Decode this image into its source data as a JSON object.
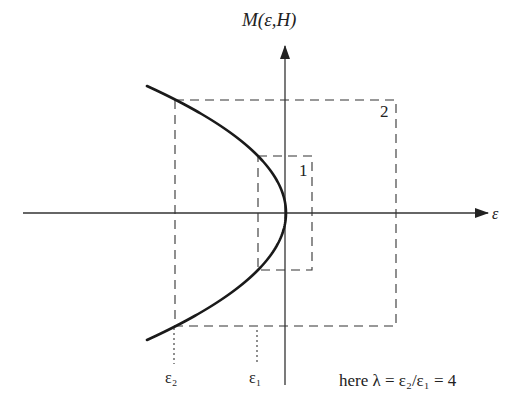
{
  "figure": {
    "y_axis_label": "M(ε,H)",
    "x_axis_label": "ε",
    "box_labels": [
      "1",
      "2"
    ],
    "tick_labels": {
      "eps2": "ε₂",
      "eps1": "ε₁"
    },
    "annotation": "here λ = ε₂/ε₁ = 4",
    "colors": {
      "ink": "#222222",
      "background": "#ffffff"
    }
  },
  "geometry": {
    "origin": {
      "x": 286,
      "y": 213
    },
    "x_axis": {
      "x1": 23,
      "x2": 488
    },
    "y_axis": {
      "y1": 46,
      "y2": 385
    },
    "curve": {
      "type": "parabola",
      "k": 0.00862,
      "m_range": [
        -127,
        127
      ]
    },
    "box_1": {
      "left": 258,
      "top": 156,
      "right": 312,
      "bottom": 270
    },
    "box_2": {
      "left": 175,
      "top": 100,
      "right": 396,
      "bottom": 326
    },
    "eps2_x": 174,
    "eps1_x": 257
  }
}
